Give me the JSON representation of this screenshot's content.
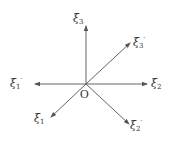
{
  "diagram": {
    "type": "coordinate-axes",
    "origin": {
      "label": "O",
      "x": 86,
      "y": 84
    },
    "stroke_color": "#555555",
    "text_color": "#333333",
    "axes": [
      {
        "id": "xi3",
        "symbol": "ξ",
        "sub": "3",
        "prime": "",
        "tip": [
          86,
          26
        ],
        "label_pos": [
          73,
          13
        ]
      },
      {
        "id": "xi3p",
        "symbol": "ξ",
        "sub": "3",
        "prime": "′",
        "tip": [
          130,
          43
        ],
        "label_pos": [
          133,
          37
        ]
      },
      {
        "id": "xi2",
        "symbol": "ξ",
        "sub": "2",
        "prime": "",
        "tip": [
          147,
          84
        ],
        "label_pos": [
          151,
          78
        ]
      },
      {
        "id": "xi1p",
        "symbol": "ξ",
        "sub": "1",
        "prime": "′",
        "tip": [
          35,
          84
        ],
        "label_pos": [
          10,
          78
        ]
      },
      {
        "id": "xi1",
        "symbol": "ξ",
        "sub": "1",
        "prime": "",
        "tip": [
          51,
          117
        ],
        "label_pos": [
          34,
          113
        ]
      },
      {
        "id": "xi2p",
        "symbol": "ξ",
        "sub": "2",
        "prime": "′",
        "tip": [
          129,
          124
        ],
        "label_pos": [
          130,
          120
        ]
      }
    ]
  }
}
